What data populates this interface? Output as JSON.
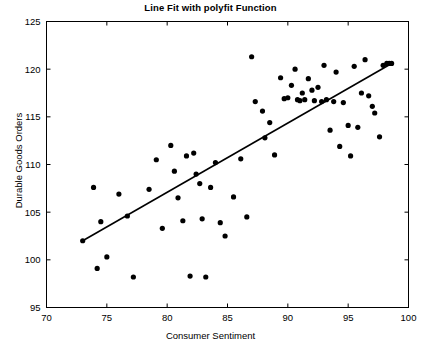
{
  "chart_data": {
    "type": "scatter",
    "title": "Line Fit with polyfit Function",
    "xlabel": "Consumer Sentiment",
    "ylabel": "Durable Goods Orders",
    "xlim": [
      70,
      100
    ],
    "ylim": [
      95,
      125
    ],
    "xticks": [
      70,
      75,
      80,
      85,
      90,
      95,
      100
    ],
    "yticks": [
      95,
      100,
      105,
      110,
      115,
      120,
      125
    ],
    "grid": false,
    "legend": null,
    "marker_color": "#000000",
    "line_color": "#000000",
    "series": [
      {
        "name": "Observations",
        "type": "scatter",
        "points": [
          [
            73.0,
            102.0
          ],
          [
            73.9,
            107.6
          ],
          [
            74.2,
            99.1
          ],
          [
            74.5,
            104.0
          ],
          [
            75.0,
            100.3
          ],
          [
            76.0,
            106.9
          ],
          [
            76.7,
            104.6
          ],
          [
            77.2,
            98.2
          ],
          [
            78.5,
            107.4
          ],
          [
            79.1,
            110.5
          ],
          [
            79.6,
            103.3
          ],
          [
            80.3,
            112.0
          ],
          [
            80.6,
            109.3
          ],
          [
            80.9,
            106.5
          ],
          [
            81.3,
            104.1
          ],
          [
            81.6,
            110.9
          ],
          [
            81.9,
            98.3
          ],
          [
            82.2,
            111.2
          ],
          [
            82.4,
            109.0
          ],
          [
            82.7,
            108.0
          ],
          [
            82.9,
            104.3
          ],
          [
            83.2,
            98.2
          ],
          [
            83.6,
            107.6
          ],
          [
            84.0,
            110.2
          ],
          [
            84.4,
            103.9
          ],
          [
            84.8,
            102.5
          ],
          [
            85.5,
            106.6
          ],
          [
            86.1,
            110.6
          ],
          [
            86.6,
            104.5
          ],
          [
            87.0,
            121.3
          ],
          [
            87.3,
            116.6
          ],
          [
            87.9,
            115.6
          ],
          [
            88.1,
            112.8
          ],
          [
            88.5,
            114.4
          ],
          [
            88.9,
            111.0
          ],
          [
            89.4,
            119.1
          ],
          [
            89.7,
            116.9
          ],
          [
            90.0,
            117.0
          ],
          [
            90.3,
            118.3
          ],
          [
            90.6,
            120.0
          ],
          [
            90.8,
            116.8
          ],
          [
            91.0,
            116.7
          ],
          [
            91.2,
            117.5
          ],
          [
            91.4,
            116.8
          ],
          [
            91.7,
            119.0
          ],
          [
            92.0,
            117.8
          ],
          [
            92.2,
            116.7
          ],
          [
            92.5,
            118.1
          ],
          [
            92.8,
            116.6
          ],
          [
            93.0,
            120.4
          ],
          [
            93.2,
            116.8
          ],
          [
            93.5,
            113.6
          ],
          [
            93.8,
            116.6
          ],
          [
            94.0,
            119.7
          ],
          [
            94.3,
            111.9
          ],
          [
            94.6,
            116.5
          ],
          [
            95.0,
            114.1
          ],
          [
            95.2,
            110.9
          ],
          [
            95.5,
            120.3
          ],
          [
            95.8,
            113.9
          ],
          [
            96.1,
            117.5
          ],
          [
            96.4,
            121.0
          ],
          [
            96.7,
            117.2
          ],
          [
            97.0,
            116.1
          ],
          [
            97.2,
            115.4
          ],
          [
            97.6,
            112.9
          ],
          [
            97.9,
            120.4
          ],
          [
            98.2,
            120.6
          ],
          [
            98.4,
            120.6
          ],
          [
            98.6,
            120.6
          ]
        ]
      },
      {
        "name": "polyfit line",
        "type": "line",
        "points": [
          [
            73.0,
            102.0
          ],
          [
            98.6,
            120.6
          ]
        ]
      }
    ]
  }
}
